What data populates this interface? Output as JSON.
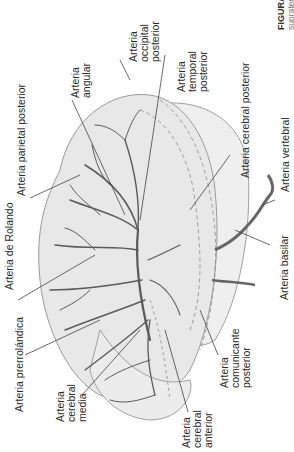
{
  "figure": {
    "caption_title": "FIGURA",
    "caption_subtitle": "supraten",
    "orientation": "rotated -90deg",
    "colors": {
      "background": "#ffffff",
      "brain_fill": "#e8e8e8",
      "outline": "#9a9a9a",
      "vessel": "#5a5a5a",
      "leader_line": "#444444",
      "dashed": "#8a8a8a"
    }
  },
  "labels": {
    "parietal_posterior": [
      "Arteria parietal posterior"
    ],
    "angular": [
      "Arteria",
      "angular"
    ],
    "occipital_posterior": [
      "Arteria",
      "occipital",
      "posterior"
    ],
    "temporal_posterior": [
      "Arteria",
      "temporal",
      "posterior"
    ],
    "cerebral_posterior": [
      "Arteria cerebral posterior"
    ],
    "vertebral": [
      "Arteria vertebral"
    ],
    "basilar": [
      "Arteria basilar"
    ],
    "rolando": [
      "Arteria de Rolando"
    ],
    "prerrolandica": [
      "Arteria prerrolándica"
    ],
    "cerebral_media": [
      "Arteria",
      "cerebral",
      "media"
    ],
    "cerebral_anterior": [
      "Arteria",
      "cerebral",
      "anterior"
    ],
    "comunicante_posterior": [
      "Arteria",
      "comunicante",
      "posterior"
    ]
  }
}
